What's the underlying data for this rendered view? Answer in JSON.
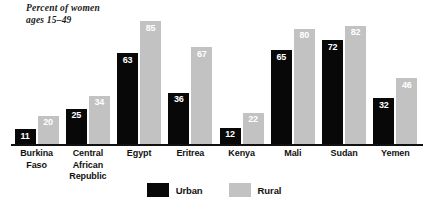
{
  "chart_data": {
    "type": "bar",
    "title": "Percent of women\nages 15–49",
    "xlabel": "",
    "ylabel": "",
    "ylim": [
      0,
      90
    ],
    "grid": false,
    "legend_position": "bottom-center",
    "categories": [
      "Burkina\nFaso",
      "Central\nAfrican\nRepublic",
      "Egypt",
      "Eritrea",
      "Kenya",
      "Mali",
      "Sudan",
      "Yemen"
    ],
    "series": [
      {
        "name": "Urban",
        "color": "#080808",
        "values": [
          11,
          25,
          63,
          36,
          12,
          65,
          72,
          32
        ]
      },
      {
        "name": "Rural",
        "color": "#c2c2c2",
        "values": [
          20,
          34,
          85,
          67,
          22,
          80,
          82,
          46
        ]
      }
    ]
  },
  "legend": {
    "items": [
      {
        "label": "Urban",
        "swatch": "urban-swatch"
      },
      {
        "label": "Rural",
        "swatch": "rural-swatch"
      }
    ]
  }
}
